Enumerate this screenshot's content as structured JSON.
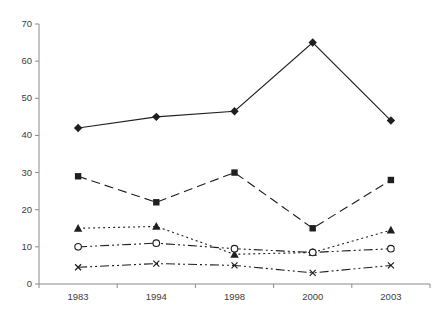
{
  "chart_data": {
    "type": "line",
    "title": "",
    "xlabel": "",
    "ylabel": "",
    "categories": [
      "1983",
      "1994",
      "1998",
      "2000",
      "2003"
    ],
    "series": [
      {
        "name": "series-diamond-solid",
        "marker": "diamond-filled",
        "line_style": "solid",
        "values": [
          42,
          45,
          46.5,
          65,
          44
        ]
      },
      {
        "name": "series-square-dashed",
        "marker": "square-filled",
        "line_style": "dashed",
        "values": [
          29,
          22,
          30,
          15,
          28
        ]
      },
      {
        "name": "series-triangle-dotted",
        "marker": "triangle-filled",
        "line_style": "dotted",
        "values": [
          15,
          15.5,
          8,
          8.5,
          14.5
        ]
      },
      {
        "name": "series-circle-dashdotdot",
        "marker": "circle-open",
        "line_style": "dash-dot-dot",
        "values": [
          10,
          11,
          9.5,
          8.5,
          9.5
        ]
      },
      {
        "name": "series-x-dashdotdot",
        "marker": "x-cross",
        "line_style": "dash-dot-dot",
        "values": [
          4.5,
          5.5,
          5,
          3,
          5
        ]
      }
    ],
    "ylim": [
      0,
      70
    ],
    "y_ticks": [
      0,
      10,
      20,
      30,
      40,
      50,
      60,
      70
    ],
    "grid": false,
    "legend": "none",
    "colors": {
      "series_stroke": "#1f1f1f",
      "axis_stroke": "#8a8a8a",
      "tick_label": "#3d3d3d",
      "background": "#ffffff",
      "open_marker_fill": "#ffffff"
    }
  }
}
